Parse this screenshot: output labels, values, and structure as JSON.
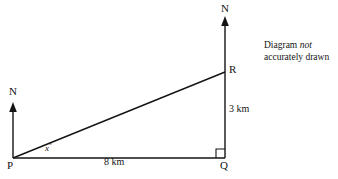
{
  "diagram": {
    "note": {
      "line1_before": "Diagram ",
      "line1_emphasis": "not",
      "line2": "accurately drawn"
    },
    "vertices": [
      {
        "id": "P",
        "label": "P",
        "x": 13,
        "y": 158
      },
      {
        "id": "Q",
        "label": "Q",
        "x": 225,
        "y": 158
      },
      {
        "id": "R",
        "label": "R",
        "x": 225,
        "y": 72
      }
    ],
    "compass": [
      {
        "id": "north-at-P",
        "label": "N",
        "x": 13,
        "tip_y": 103,
        "base_y": 158
      },
      {
        "id": "north-at-Q",
        "label": "N",
        "x": 225,
        "tip_y": 17,
        "base_y": 72
      }
    ],
    "measures": [
      {
        "id": "PQ",
        "label": "8 km",
        "value": 8,
        "unit": "km"
      },
      {
        "id": "QR",
        "label": "3 km",
        "value": 3,
        "unit": "km"
      }
    ],
    "angle": {
      "id": "angle-at-P",
      "variable": "x",
      "degree_symbol": "°",
      "label": "x°"
    },
    "right_angle": {
      "id": "right-angle-at-Q",
      "marker": "square",
      "degrees": 90
    },
    "colors": {
      "stroke": "#141414",
      "text": "#141414",
      "background": "#ffffff"
    }
  }
}
